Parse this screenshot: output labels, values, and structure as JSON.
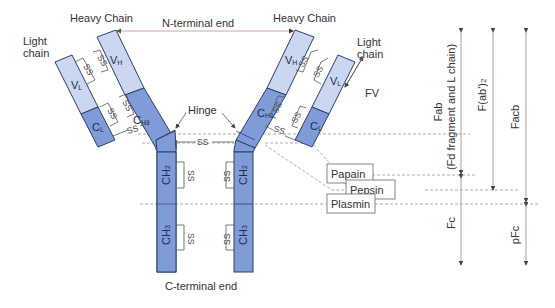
{
  "labels": {
    "heavy_chain_left": "Heavy Chain",
    "heavy_chain_right": "Heavy Chain",
    "light_chain_left_1": "Light",
    "light_chain_left_2": "chain",
    "light_chain_right_1": "Light",
    "light_chain_right_2": "chain",
    "n_terminal": "N-terminal end",
    "c_terminal": "C-terminal end",
    "hinge": "Hinge",
    "fv": "FV"
  },
  "domains": {
    "vl": "V",
    "vl_sub": "L",
    "cl": "C",
    "cl_sub": "L",
    "vh": "V",
    "vh_sub": "H",
    "ch1": "C",
    "ch1_sub": "H1",
    "ch2": "CH",
    "ch2_sub": "2",
    "ch3": "CH",
    "ch3_sub": "3"
  },
  "disulfide": "SS",
  "enzymes": {
    "papain": "Papain",
    "pepsin": "Pepsin",
    "plasmin": "Plasmin"
  },
  "fragments": {
    "fab_1": "Fab",
    "fab_2": "(Fd fragment and L chain)",
    "fab2": "F(ab')",
    "fab2_sub": "2",
    "facb": "Facb",
    "fc": "Fc",
    "pfc": "pFc"
  },
  "colors": {
    "variable_domain": "#c9d8f0",
    "constant_domain": "#7f9bd8",
    "outline": "#2d3e66"
  }
}
